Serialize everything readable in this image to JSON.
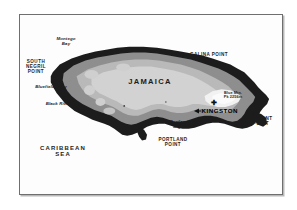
{
  "figure": {
    "title_region": "Jamaica relief map",
    "frame_color": "#6f6f6f",
    "background": "#fdfdfd"
  },
  "map": {
    "country_label": "JAMAICA",
    "sea_label": "CARIBBEAN\nSEA",
    "capital": {
      "name": "KINGSTON",
      "marker": "arrow-pointer"
    },
    "peak": {
      "name": "Blue Mtn.",
      "elevation_label": "Pk 2256m",
      "marker": "cross-marker"
    },
    "relief_colors": {
      "coast_dark": "#1c1c1c",
      "mid_gray": "#8e8e8e",
      "light_gray": "#b9b9b9",
      "interior_pale": "#d2d2d2",
      "highland_white": "#f2f2f2",
      "sea": "#fdfdfd"
    },
    "points": [
      {
        "id": "south-negril-point",
        "label": "SOUTH\nNEGRIL\nPOINT",
        "style": "caps"
      },
      {
        "id": "galina-point",
        "label": "GALINA POINT",
        "style": "caps"
      },
      {
        "id": "morant-point",
        "label": "MORANT\nPOINT",
        "style": "caps"
      },
      {
        "id": "portland-point",
        "label": "PORTLAND\nPOINT",
        "style": "caps"
      }
    ],
    "bays": [
      {
        "id": "montego-bay",
        "label": "Montego\nBay",
        "style": "italic"
      },
      {
        "id": "bluefields-bay",
        "label": "Bluefields Bay",
        "style": "italic"
      },
      {
        "id": "black-river-bay",
        "label": "Black River Bay",
        "style": "italic"
      },
      {
        "id": "long-bay",
        "label": "Long Bay",
        "style": "italic"
      },
      {
        "id": "portland-bight",
        "label": "Portland\nBight",
        "style": "italic"
      }
    ]
  }
}
